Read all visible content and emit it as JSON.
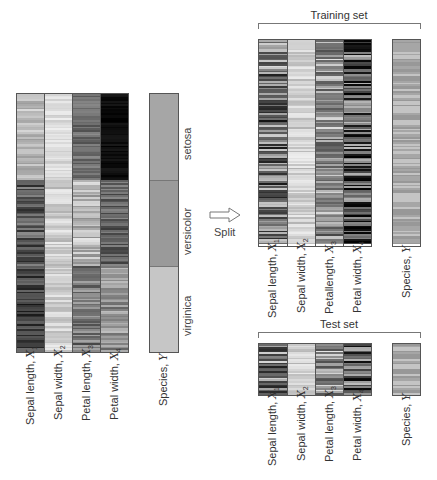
{
  "colors": {
    "setosa": "#a6a6a6",
    "versicolor": "#979797",
    "virginica": "#c4c4c4",
    "border": "#555555",
    "text": "#333333"
  },
  "features": [
    {
      "name": "Sepal length",
      "var": "X",
      "sub": "1"
    },
    {
      "name": "Sepal width",
      "var": "X",
      "sub": "2"
    },
    {
      "name": "Petal length",
      "var": "X",
      "sub": "3"
    },
    {
      "name": "Petal width",
      "var": "X",
      "sub": "4"
    }
  ],
  "species_label": {
    "name": "Species",
    "var": "Y"
  },
  "classes": [
    "setosa",
    "versicolor",
    "virginica"
  ],
  "full_dataset": {
    "rows": 150,
    "class_boundaries": [
      50,
      100,
      150
    ],
    "feature_gray_ranges": [
      [
        [
          150,
          220
        ],
        [
          40,
          140
        ],
        [
          20,
          110
        ]
      ],
      [
        [
          200,
          240
        ],
        [
          175,
          235
        ],
        [
          185,
          235
        ]
      ],
      [
        [
          80,
          140
        ],
        [
          140,
          230
        ],
        [
          70,
          170
        ]
      ],
      [
        [
          0,
          25
        ],
        [
          60,
          140
        ],
        [
          100,
          190
        ]
      ]
    ]
  },
  "split": {
    "label": "Split",
    "arrow_icon": "right-arrow-outline"
  },
  "training_set": {
    "title": "Training set",
    "rows": 120
  },
  "test_set": {
    "title": "Test set",
    "rows": 30
  },
  "labels": {
    "full": [
      "Sepal length, ",
      "Sepal width, ",
      "Petal length, ",
      "Petal width, "
    ],
    "training": [
      "Sepal length, ",
      "Sepal width, ",
      "Petallength, ",
      "Petal width, "
    ],
    "test": [
      "Sepal length, ",
      "Sepal width, ",
      "Petal length, ",
      "Petal width, "
    ],
    "species": "Species, "
  }
}
